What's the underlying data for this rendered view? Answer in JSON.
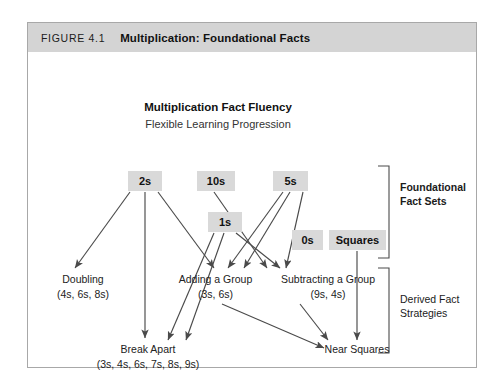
{
  "figure": {
    "number": "FIGURE 4.1",
    "title": "Multiplication: Foundational Facts"
  },
  "diagram": {
    "title": "Multiplication Fact Fluency",
    "subtitle": "Flexible Learning Progression",
    "foundational_boxes": [
      {
        "id": "two",
        "label": "2s"
      },
      {
        "id": "ten",
        "label": "10s"
      },
      {
        "id": "five",
        "label": "5s"
      },
      {
        "id": "one",
        "label": "1s"
      },
      {
        "id": "zero",
        "label": "0s"
      },
      {
        "id": "squares",
        "label": "Squares"
      }
    ],
    "derived_strategies": [
      {
        "id": "doubling",
        "name": "Doubling",
        "facts": "(4s, 6s, 8s)"
      },
      {
        "id": "adding",
        "name": "Adding a Group",
        "facts": "(3s, 6s)"
      },
      {
        "id": "subtracting",
        "name": "Subtracting a Group",
        "facts": "(9s, 4s)"
      },
      {
        "id": "break-apart",
        "name": "Break Apart",
        "facts": "(3s, 4s, 6s, 7s, 8s, 9s)"
      },
      {
        "id": "near-squares",
        "name": "Near Squares",
        "facts": ""
      }
    ],
    "brackets": [
      {
        "id": "foundational",
        "line1": "Foundational",
        "line2": "Fact Sets",
        "bold": true
      },
      {
        "id": "derived",
        "line1": "Derived Fact",
        "line2": "Strategies",
        "bold": false
      }
    ],
    "colors": {
      "box_fill": "#d9d9d9",
      "header_fill": "#d4d4d4",
      "frame_border": "#a8a8a8",
      "arrow": "#4a4a4a"
    }
  }
}
